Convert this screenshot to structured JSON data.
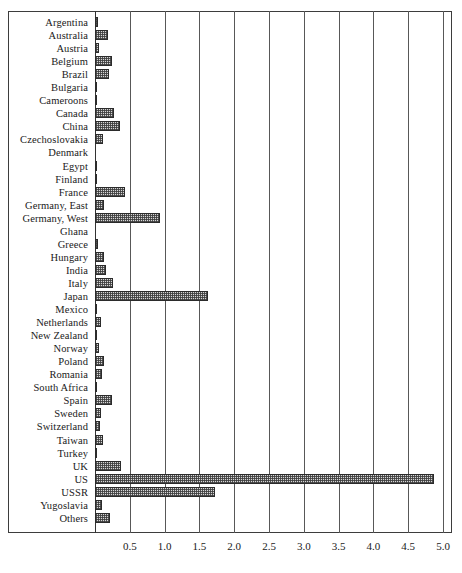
{
  "chart_data": {
    "type": "bar",
    "orientation": "horizontal",
    "title": "",
    "xlabel": "",
    "ylabel": "",
    "xlim": [
      0,
      5.0
    ],
    "ylim": null,
    "grid": true,
    "legend": null,
    "xticks": [
      "0.5",
      "1.0",
      "1.5",
      "2.0",
      "2.5",
      "3.0",
      "3.5",
      "4.0",
      "4.5",
      "5.0"
    ],
    "xtick_values": [
      0.5,
      1.0,
      1.5,
      2.0,
      2.5,
      3.0,
      3.5,
      4.0,
      4.5,
      5.0
    ],
    "categories": [
      "Argentina",
      "Australia",
      "Austria",
      "Belgium",
      "Brazil",
      "Bulgaria",
      "Cameroons",
      "Canada",
      "China",
      "Czechoslovakia",
      "Denmark",
      "Egypt",
      "Finland",
      "France",
      "Germany, East",
      "Germany, West",
      "Ghana",
      "Greece",
      "Hungary",
      "India",
      "Italy",
      "Japan",
      "Mexico",
      "Netherlands",
      "New Zealand",
      "Norway",
      "Poland",
      "Romania",
      "South Africa",
      "Spain",
      "Sweden",
      "Switzerland",
      "Taiwan",
      "Turkey",
      "UK",
      "US",
      "USSR",
      "Yugoslavia",
      "Others"
    ],
    "values": [
      0.04,
      0.18,
      0.06,
      0.24,
      0.2,
      0.03,
      0.01,
      0.27,
      0.36,
      0.12,
      0.0,
      0.02,
      0.02,
      0.43,
      0.13,
      0.93,
      0.0,
      0.05,
      0.13,
      0.16,
      0.26,
      1.62,
      0.02,
      0.08,
      0.02,
      0.06,
      0.13,
      0.1,
      0.02,
      0.24,
      0.09,
      0.07,
      0.11,
      0.03,
      0.38,
      4.87,
      1.73,
      0.1,
      0.22
    ],
    "colors": {
      "bar_fill": "#d6d6d6",
      "bar_edge": "#2b2b2b",
      "grid": "#585858",
      "frame": "#3d3d3d",
      "text": "#1a1a1a"
    }
  }
}
